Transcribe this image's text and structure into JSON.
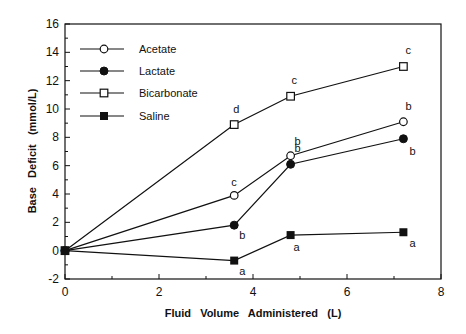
{
  "chart_data": {
    "type": "line",
    "title": "",
    "xlabel": "Fluid   Volume   Administered   (L)",
    "ylabel": "Base   Deficit   (mmol/L)",
    "xlim": [
      0,
      8
    ],
    "ylim": [
      -2,
      16
    ],
    "xticks": [
      0,
      2,
      4,
      6,
      8
    ],
    "yticks": [
      -2,
      0,
      2,
      4,
      6,
      8,
      10,
      12,
      14,
      16
    ],
    "grid": false,
    "legend_position": "upper-left",
    "x": [
      0,
      3.6,
      4.8,
      7.2
    ],
    "series": [
      {
        "name": "Acetate",
        "marker": "open-circle",
        "values": [
          0,
          3.9,
          6.7,
          9.1
        ],
        "labels": [
          "",
          "c",
          "b",
          "b"
        ]
      },
      {
        "name": "Lactate",
        "marker": "filled-circle",
        "values": [
          0,
          1.8,
          6.1,
          7.9
        ],
        "labels": [
          "",
          "b",
          "b",
          "b"
        ]
      },
      {
        "name": "Bicarbonate",
        "marker": "open-square",
        "values": [
          0,
          8.9,
          10.9,
          13.0
        ],
        "labels": [
          "",
          "d",
          "c",
          "c"
        ]
      },
      {
        "name": "Saline",
        "marker": "filled-square",
        "values": [
          0,
          -0.7,
          1.1,
          1.3
        ],
        "labels": [
          "",
          "a",
          "a",
          "a"
        ]
      }
    ]
  }
}
